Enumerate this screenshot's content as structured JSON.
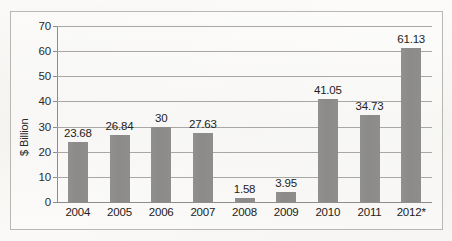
{
  "chart_data": {
    "type": "bar",
    "title": "",
    "subtitle": "",
    "xlabel": "",
    "ylabel": "$ Billion",
    "ylim": [
      0,
      70
    ],
    "ytick_step": 10,
    "yticks": [
      "70",
      "60",
      "50",
      "40",
      "30",
      "20",
      "10",
      "0"
    ],
    "grid": true,
    "legend": false,
    "legend_position": "none",
    "categories": [
      "2004",
      "2005",
      "2006",
      "2007",
      "2008",
      "2009",
      "2010",
      "2011",
      "2012*"
    ],
    "values": [
      23.68,
      26.84,
      30,
      27.63,
      1.58,
      3.95,
      41.05,
      34.73,
      61.13
    ],
    "value_labels": [
      "23.68",
      "26.84",
      "30",
      "27.63",
      "1.58",
      "3.95",
      "41.05",
      "34.73",
      "61.13"
    ],
    "bar_color": "#8c8b8a",
    "gridline_color": "#a9a7a4",
    "axis_color": "#8f8d8a",
    "text_color": "#232220",
    "background_color": "#fbfaf8",
    "annotations": [
      "2012* denotes a projected or estimated value"
    ]
  }
}
